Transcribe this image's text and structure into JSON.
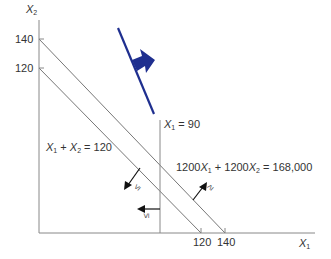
{
  "diagram": {
    "type": "linear-programming-constraints",
    "axes": {
      "x_label_var": "X",
      "x_label_sub": "1",
      "y_label_var": "X",
      "y_label_sub": "2",
      "x_ticks": [
        "120",
        "140"
      ],
      "y_ticks": [
        "140",
        "120"
      ]
    },
    "constraints": [
      {
        "label_var1": "X",
        "sub1": "1",
        "plus": " + ",
        "label_var2": "X",
        "sub2": "2",
        "rhs": " = 120",
        "direction": "≤"
      },
      {
        "label_pre": "1200",
        "label_var1": "X",
        "sub1": "1",
        "mid": " + 1200",
        "label_var2": "X",
        "sub2": "2",
        "rhs": " = 168,000",
        "direction": "≥"
      },
      {
        "label_var1": "X",
        "sub1": "1",
        "rhs": " = 90",
        "direction": "≤"
      }
    ],
    "objective_arrow": {
      "color": "#1f2f8f",
      "meaning": "direction of improvement"
    }
  }
}
